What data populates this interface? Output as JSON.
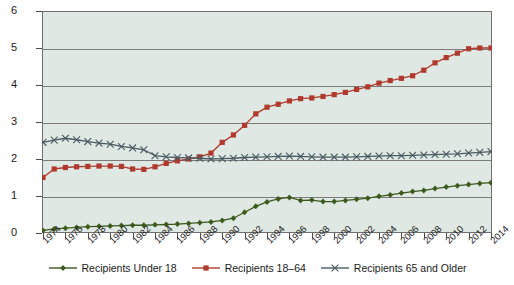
{
  "chart_data": {
    "type": "line",
    "title": "",
    "xlabel": "",
    "ylabel": "Number (in thousands)",
    "ylim": [
      0,
      6
    ],
    "yticks": [
      0,
      1,
      2,
      3,
      4,
      5,
      6
    ],
    "ytick_labels": [
      "0",
      "1",
      "2",
      "3",
      "4",
      "5",
      "6"
    ],
    "grid": "horizontal",
    "legend_position": "bottom",
    "x": [
      1974,
      1975,
      1976,
      1977,
      1978,
      1979,
      1980,
      1981,
      1982,
      1983,
      1984,
      1985,
      1986,
      1987,
      1988,
      1989,
      1990,
      1991,
      1992,
      1993,
      1994,
      1995,
      1996,
      1997,
      1998,
      1999,
      2000,
      2001,
      2002,
      2003,
      2004,
      2005,
      2006,
      2007,
      2008,
      2009,
      2010,
      2011,
      2012,
      2013,
      2014
    ],
    "xtick_labels": [
      "1974",
      "1976",
      "1978",
      "1980",
      "1982",
      "1984",
      "1986",
      "1988",
      "1990",
      "1992",
      "1994",
      "1996",
      "1998",
      "2000",
      "2002",
      "2004",
      "2006",
      "2008",
      "2010",
      "2012",
      "2014"
    ],
    "series": [
      {
        "name": "Recipients Under 18",
        "color": "#3d5a1e",
        "marker": "diamond",
        "values": [
          0.07,
          0.11,
          0.13,
          0.15,
          0.17,
          0.18,
          0.19,
          0.2,
          0.21,
          0.21,
          0.22,
          0.23,
          0.24,
          0.26,
          0.28,
          0.3,
          0.34,
          0.4,
          0.56,
          0.72,
          0.84,
          0.92,
          0.96,
          0.88,
          0.89,
          0.85,
          0.85,
          0.88,
          0.91,
          0.94,
          0.99,
          1.03,
          1.08,
          1.12,
          1.15,
          1.2,
          1.24,
          1.28,
          1.31,
          1.34,
          1.36
        ]
      },
      {
        "name": "Recipients 18–64",
        "color": "#b03a2e",
        "marker": "square",
        "values": [
          1.5,
          1.73,
          1.77,
          1.79,
          1.8,
          1.81,
          1.81,
          1.8,
          1.73,
          1.72,
          1.79,
          1.88,
          1.95,
          2.0,
          2.06,
          2.16,
          2.45,
          2.65,
          2.91,
          3.22,
          3.4,
          3.48,
          3.57,
          3.63,
          3.65,
          3.69,
          3.74,
          3.8,
          3.88,
          3.95,
          4.05,
          4.12,
          4.18,
          4.25,
          4.4,
          4.6,
          4.74,
          4.86,
          4.98,
          5.0,
          5.0
        ]
      },
      {
        "name": "Recipients 65 and Older",
        "color": "#4a5a64",
        "marker": "cross",
        "values": [
          2.45,
          2.51,
          2.56,
          2.52,
          2.47,
          2.43,
          2.4,
          2.34,
          2.3,
          2.25,
          2.09,
          2.06,
          2.04,
          2.03,
          2.02,
          2.0,
          2.01,
          2.02,
          2.04,
          2.05,
          2.06,
          2.07,
          2.08,
          2.07,
          2.06,
          2.05,
          2.05,
          2.05,
          2.06,
          2.07,
          2.08,
          2.09,
          2.09,
          2.1,
          2.11,
          2.12,
          2.13,
          2.14,
          2.16,
          2.18,
          2.2
        ]
      }
    ]
  }
}
